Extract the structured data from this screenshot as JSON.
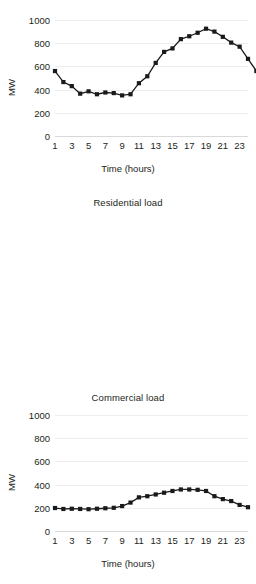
{
  "chart_data": [
    {
      "id": "total",
      "type": "line",
      "title": "",
      "xlabel": "Time (hours)",
      "ylabel": "MW",
      "ylim": [
        0,
        1000
      ],
      "yticks": [
        0,
        200,
        400,
        600,
        800,
        1000
      ],
      "ytick_labels": [
        "0",
        "200",
        "400",
        "600",
        "800",
        "1000"
      ],
      "xlim": [
        1,
        24
      ],
      "xticks": [
        1,
        3,
        5,
        7,
        9,
        11,
        13,
        15,
        17,
        19,
        21,
        23
      ],
      "xtick_labels": [
        "1",
        "3",
        "5",
        "7",
        "9",
        "11",
        "13",
        "15",
        "17",
        "19",
        "21",
        "23"
      ],
      "grid": true,
      "marker": "square",
      "x": [
        1,
        2,
        3,
        4,
        5,
        6,
        7,
        8,
        9,
        10,
        11,
        12,
        13,
        14,
        15,
        16,
        17,
        18,
        19,
        20,
        21,
        22,
        23,
        24
      ],
      "values": [
        560,
        465,
        430,
        365,
        385,
        360,
        375,
        370,
        350,
        360,
        455,
        515,
        630,
        725,
        755,
        835,
        860,
        890,
        925,
        900,
        855,
        805,
        770,
        665,
        560
      ]
    },
    {
      "id": "residential",
      "type": "line",
      "title": "Residential load",
      "xlabel": "Time (hours)",
      "ylabel": "MW",
      "ylim": [
        0,
        1000
      ],
      "yticks": [
        0,
        200,
        400,
        600,
        800,
        1000
      ],
      "ytick_labels": [
        "0",
        "200",
        "400",
        "600",
        "800",
        "1000"
      ],
      "xlim": [
        1,
        24
      ],
      "xticks": [
        1,
        3,
        5,
        7,
        9,
        11,
        13,
        15,
        17,
        19,
        21,
        23
      ],
      "xtick_labels": [
        "1",
        "3",
        "5",
        "7",
        "9",
        "11",
        "13",
        "15",
        "17",
        "19",
        "21",
        "23"
      ],
      "grid": true,
      "marker": "square",
      "x": [
        1,
        2,
        3,
        4,
        5,
        6,
        7,
        8,
        9,
        10,
        11,
        12,
        13,
        14,
        15,
        16,
        17,
        18,
        19,
        20,
        21,
        22,
        23,
        24
      ],
      "values": [
        198,
        190,
        192,
        190,
        188,
        192,
        196,
        200,
        215,
        245,
        290,
        300,
        315,
        330,
        345,
        358,
        358,
        355,
        345,
        300,
        275,
        258,
        225,
        205
      ]
    },
    {
      "id": "commercial",
      "type": "line",
      "title": "Commercial load",
      "xlabel": "Time (hours)",
      "ylabel": "MW",
      "ylim": [
        0,
        1000
      ],
      "yticks": [
        0,
        200,
        400,
        600,
        800,
        1000
      ],
      "ytick_labels": [
        "0",
        "200",
        "400",
        "600",
        "800",
        "1000"
      ],
      "xlim": [
        1,
        24
      ],
      "xticks": [
        1,
        3,
        5,
        7,
        9,
        11,
        13,
        15,
        17,
        19,
        21,
        23
      ],
      "xtick_labels": [
        "1",
        "3",
        "5",
        "7",
        "9",
        "11",
        "13",
        "15",
        "17",
        "19",
        "21",
        "23"
      ],
      "grid": true,
      "marker": "square",
      "x": [
        1,
        2,
        3,
        4,
        5,
        6,
        7,
        8,
        9,
        10,
        11,
        12,
        13,
        14,
        15,
        16,
        17,
        18,
        19,
        20,
        21,
        22,
        23,
        24
      ],
      "values": [
        182,
        178,
        172,
        175,
        170,
        178,
        188,
        190,
        195,
        210,
        212,
        215,
        210,
        208,
        205,
        200,
        198,
        195,
        185,
        180,
        178,
        180,
        178,
        172
      ]
    }
  ],
  "style": {
    "series_color": "#1a1a1a",
    "grid_color": "#ededed",
    "axis_color": "#d9d9d9",
    "text_color": "#231f20"
  }
}
